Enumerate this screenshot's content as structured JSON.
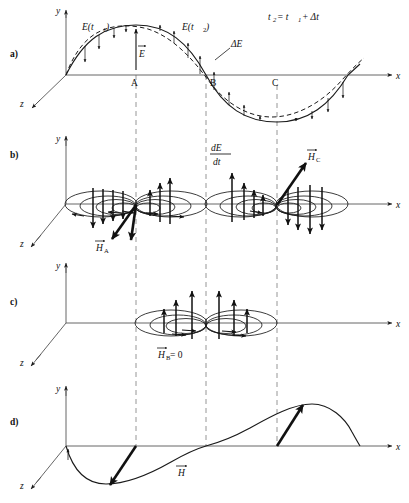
{
  "figure": {
    "panels": [
      {
        "id": "a",
        "label": "a)",
        "description": "Electric field sine wave at two instants with difference vectors"
      },
      {
        "id": "b",
        "label": "b)",
        "description": "Displacement current dE/dt with circular magnetic field loops"
      },
      {
        "id": "c",
        "label": "c)",
        "description": "Magnetic field loops at node B where H is zero"
      },
      {
        "id": "d",
        "label": "d)",
        "description": "Resulting magnetic field H wave along x"
      }
    ]
  },
  "axes": {
    "x_label": "x",
    "y_label": "y",
    "z_label": "z"
  },
  "panel_a": {
    "panel_label": "a)",
    "curve_label_t1": "E(t",
    "curve_label_t1_sub": "1",
    "curve_label_t1_close": ")",
    "curve_label_t2": "E(t",
    "curve_label_t2_sub": "2",
    "curve_label_t2_close": ")",
    "delta_label": "ΔE",
    "e_vector_label": "E",
    "equation": {
      "lhs": "t",
      "lhs_sub": "2",
      "eq": " = t",
      "rhs_sub": "1",
      "plus": " + Δt"
    },
    "markers": [
      "A",
      "B",
      "C"
    ],
    "x_label": "x",
    "y_label": "y",
    "z_label": "z"
  },
  "panel_b": {
    "panel_label": "b)",
    "derivative_numerator": "dE",
    "derivative_denominator": "dt",
    "h_a_label": "H",
    "h_a_sub": "A",
    "h_c_label": "H",
    "h_c_sub": "C",
    "x_label": "x",
    "y_label": "y",
    "z_label": "z"
  },
  "panel_c": {
    "panel_label": "c)",
    "h_b_label": "H",
    "h_b_sub": "B",
    "h_b_value": " = 0",
    "x_label": "x",
    "y_label": "y",
    "z_label": "z"
  },
  "panel_d": {
    "panel_label": "d)",
    "h_label": "H",
    "x_label": "x",
    "y_label": "y",
    "z_label": "z"
  },
  "colors": {
    "ink": "#1a1a1a",
    "axis_grey": "#555555",
    "guide_grey": "#8a8a8a",
    "background": "#ffffff"
  },
  "geometry": {
    "guide_x_A": 136,
    "guide_x_B": 206,
    "guide_x_C": 277,
    "panel_a_baseline_y": 75,
    "panel_b_baseline_y": 204,
    "panel_c_baseline_y": 323,
    "panel_d_baseline_y": 446
  }
}
